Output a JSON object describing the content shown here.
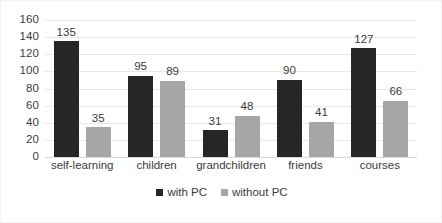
{
  "chart_data": {
    "type": "bar",
    "title": "",
    "subtitle": "",
    "xlabel": "",
    "ylabel": "",
    "categories": [
      "self-learning",
      "children",
      "grandchildren",
      "friends",
      "courses"
    ],
    "series": [
      {
        "name": "with PC",
        "color": "#262626",
        "values": [
          135,
          95,
          31,
          90,
          127
        ]
      },
      {
        "name": "without PC",
        "color": "#a6a6a6",
        "values": [
          35,
          89,
          48,
          41,
          66
        ]
      }
    ],
    "ylim": [
      0,
      160
    ],
    "ytick_step": 20,
    "yticks": [
      "160",
      "140",
      "120",
      "100",
      "80",
      "60",
      "40",
      "20",
      "0"
    ],
    "grid": true,
    "grid_axis": "y",
    "legend_position": "bottom",
    "data_labels": true
  },
  "colors": {
    "series_with_pc": "#262626",
    "series_without_pc": "#a6a6a6",
    "gridline": "#e8e8e8",
    "axis_line": "#d9d9d9",
    "text": "#3b3b3b",
    "frame_border": "#f2f2f2",
    "background": "#ffffff"
  }
}
